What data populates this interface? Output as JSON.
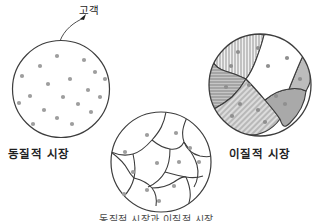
{
  "figure": {
    "title_caption": "동질적 시장과 이질적 시장",
    "background_color": "#ffffff",
    "outline_color": "#3a3a3a",
    "dot_color": "#9a9a9a",
    "annotation": {
      "label": "고객",
      "arrow_from": [
        88,
        16
      ],
      "arrow_to": [
        60,
        41
      ]
    },
    "panels": [
      {
        "id": "homogeneous",
        "label": "동질적 시장",
        "center": [
          61,
          89
        ],
        "radius": 48.5,
        "segmented": false,
        "dots": [
          [
            57,
            56
          ],
          [
            84,
            60
          ],
          [
            40,
            66
          ],
          [
            95,
            72
          ],
          [
            22,
            76
          ],
          [
            70,
            79
          ],
          [
            105,
            79
          ],
          [
            48,
            84
          ],
          [
            88,
            90
          ],
          [
            30,
            96
          ],
          [
            63,
            97
          ],
          [
            100,
            97
          ],
          [
            19,
            103
          ],
          [
            78,
            104
          ],
          [
            44,
            110
          ],
          [
            91,
            112
          ],
          [
            57,
            118
          ],
          [
            72,
            124
          ],
          [
            33,
            124
          ]
        ]
      },
      {
        "id": "segmented",
        "label": "",
        "center": [
          161,
          162
        ],
        "radius": 50,
        "segmented": true,
        "fill": "#ffffff",
        "dots": [
          [
            147,
            135
          ],
          [
            176,
            133
          ],
          [
            125,
            152
          ],
          [
            190,
            148
          ],
          [
            157,
            163
          ],
          [
            179,
            162
          ],
          [
            199,
            162
          ],
          [
            133,
            172
          ],
          [
            147,
            190
          ],
          [
            174,
            186
          ],
          [
            124,
            194
          ],
          [
            159,
            201
          ]
        ]
      },
      {
        "id": "heterogeneous",
        "label": "이질적 시장",
        "center": [
          260,
          85
        ],
        "radius": 51,
        "segmented": true,
        "regions": [
          {
            "name": "vertical-hatch-region",
            "pattern": "vertical-lines",
            "fill": "#e6e6e6"
          },
          {
            "name": "horizontal-hatch-region",
            "pattern": "horizontal-lines",
            "fill": "#c9c9c9"
          },
          {
            "name": "diagonal-hatch-region",
            "pattern": "diagonal-lines",
            "fill": "#d8d8d8"
          },
          {
            "name": "solid-gray-region-bottom",
            "pattern": "solid",
            "fill": "#a8a8a8"
          },
          {
            "name": "solid-gray-region-right",
            "pattern": "solid",
            "fill": "#b9b9b9"
          },
          {
            "name": "blank-region-center",
            "pattern": "none",
            "fill": "#ffffff"
          }
        ],
        "dots": [
          [
            238,
            52
          ],
          [
            258,
            48
          ],
          [
            287,
            58
          ],
          [
            231,
            66
          ],
          [
            268,
            66
          ],
          [
            300,
            79
          ],
          [
            249,
            85
          ],
          [
            226,
            87
          ],
          [
            276,
            96
          ],
          [
            240,
            104
          ],
          [
            258,
            110
          ],
          [
            285,
            104
          ],
          [
            232,
            116
          ],
          [
            265,
            122
          ]
        ]
      }
    ]
  }
}
